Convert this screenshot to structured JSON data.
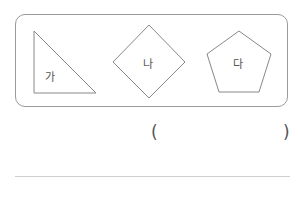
{
  "header": {
    "partial_text": ""
  },
  "shapes": [
    {
      "id": "ga",
      "type": "right-triangle",
      "label": "가"
    },
    {
      "id": "na",
      "type": "diamond",
      "label": "나"
    },
    {
      "id": "da",
      "type": "pentagon",
      "label": "다"
    }
  ],
  "answer": {
    "open_paren": "(",
    "close_paren": ")",
    "value": ""
  },
  "colors": {
    "stroke": "#888888",
    "box_border": "#9a9a9a",
    "rule": "#cfcfcf"
  }
}
